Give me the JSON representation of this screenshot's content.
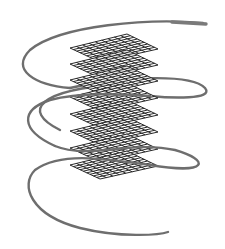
{
  "figure": {
    "colors": {
      "background": "#ffffff",
      "helix": "#707070",
      "grid": "#2a2a2a"
    },
    "grid_planes": [
      {
        "y": 48,
        "label": ""
      },
      {
        "y": 64,
        "label": ""
      },
      {
        "y": 80,
        "label": ""
      },
      {
        "y": 97,
        "label": ""
      },
      {
        "y": 114,
        "label": ""
      },
      {
        "y": 131,
        "label": ""
      },
      {
        "y": 148,
        "label": ""
      },
      {
        "y": 165,
        "label": ""
      }
    ]
  }
}
